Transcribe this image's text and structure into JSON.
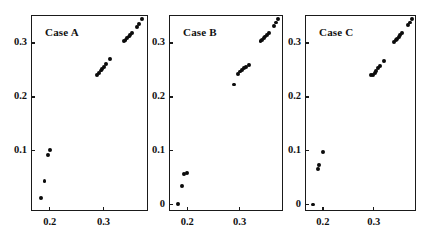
{
  "figure": {
    "background": "#ffffff",
    "ink": "#111111",
    "marker_color": "#0b0b0b",
    "panel_count": 3
  },
  "chart_data": [
    {
      "type": "scatter",
      "title": "Case A",
      "xlabel": "",
      "ylabel": "",
      "xlim": [
        0.165,
        0.383
      ],
      "ylim": [
        -0.012,
        0.352
      ],
      "grid": false,
      "legend": null,
      "xticks": [
        0.2,
        0.3
      ],
      "xtick_labels": [
        "0.2",
        "0.3"
      ],
      "yticks": [
        0.1,
        0.2,
        0.3
      ],
      "ytick_labels": [
        "0.1",
        "0.2",
        "0.3"
      ],
      "x": [
        0.183,
        0.19,
        0.196,
        0.2,
        0.288,
        0.292,
        0.295,
        0.298,
        0.301,
        0.305,
        0.312,
        0.338,
        0.341,
        0.344,
        0.347,
        0.35,
        0.353,
        0.362,
        0.366,
        0.372
      ],
      "y": [
        0.012,
        0.043,
        0.092,
        0.102,
        0.241,
        0.245,
        0.249,
        0.252,
        0.256,
        0.261,
        0.271,
        0.303,
        0.306,
        0.309,
        0.312,
        0.315,
        0.318,
        0.33,
        0.336,
        0.345
      ]
    },
    {
      "type": "scatter",
      "title": "Case B",
      "xlabel": "",
      "ylabel": "",
      "xlim": [
        0.165,
        0.383
      ],
      "ylim": [
        -0.012,
        0.352
      ],
      "grid": false,
      "legend": null,
      "xticks": [
        0.2,
        0.3
      ],
      "xtick_labels": [
        "0.2",
        "0.3"
      ],
      "yticks": [
        0.0,
        0.1,
        0.2,
        0.3
      ],
      "ytick_labels": [
        "0",
        "0.1",
        "0.2",
        "0.3"
      ],
      "x": [
        0.182,
        0.19,
        0.193,
        0.199,
        0.29,
        0.297,
        0.301,
        0.304,
        0.308,
        0.312,
        0.318,
        0.34,
        0.343,
        0.346,
        0.349,
        0.352,
        0.356,
        0.366,
        0.37,
        0.374
      ],
      "y": [
        0.001,
        0.035,
        0.057,
        0.058,
        0.223,
        0.243,
        0.247,
        0.25,
        0.254,
        0.256,
        0.259,
        0.303,
        0.306,
        0.309,
        0.312,
        0.315,
        0.319,
        0.332,
        0.338,
        0.345
      ]
    },
    {
      "type": "scatter",
      "title": "Case C",
      "xlabel": "",
      "ylabel": "",
      "xlim": [
        0.165,
        0.383
      ],
      "ylim": [
        -0.012,
        0.352
      ],
      "grid": false,
      "legend": null,
      "xticks": [
        0.2,
        0.3
      ],
      "xtick_labels": [
        "0.2",
        "0.3"
      ],
      "yticks": [
        0.0,
        0.1,
        0.2,
        0.3
      ],
      "ytick_labels": [
        "0",
        "0.1",
        "0.2",
        "0.3"
      ],
      "x": [
        0.181,
        0.19,
        0.193,
        0.2,
        0.295,
        0.299,
        0.302,
        0.305,
        0.309,
        0.313,
        0.32,
        0.34,
        0.343,
        0.346,
        0.349,
        0.352,
        0.356,
        0.367,
        0.371,
        0.375
      ],
      "y": [
        0.0,
        0.066,
        0.073,
        0.098,
        0.24,
        0.241,
        0.244,
        0.248,
        0.254,
        0.258,
        0.266,
        0.302,
        0.305,
        0.308,
        0.311,
        0.315,
        0.319,
        0.333,
        0.338,
        0.345
      ]
    }
  ],
  "panels": [
    {
      "name": "case-a",
      "frame": {
        "left": 31,
        "top": 15,
        "width": 117,
        "height": 196
      },
      "label_offset": {
        "left": 14,
        "top": 11
      }
    },
    {
      "name": "case-b",
      "frame": {
        "left": 169,
        "top": 15,
        "width": 114,
        "height": 196
      },
      "label_offset": {
        "left": 14,
        "top": 11
      }
    },
    {
      "name": "case-c",
      "frame": {
        "left": 305,
        "top": 15,
        "width": 111,
        "height": 196
      },
      "label_offset": {
        "left": 14,
        "top": 11
      }
    }
  ]
}
